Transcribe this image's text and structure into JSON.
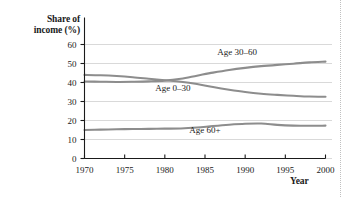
{
  "chart_data": {
    "type": "line",
    "title": "",
    "xlabel": "Year",
    "ylabel": "Share of\nincome (%)",
    "xlim": [
      1970,
      2000
    ],
    "ylim": [
      0,
      60
    ],
    "xticks": [
      1970,
      1975,
      1980,
      1985,
      1990,
      1995,
      2000
    ],
    "yticks": [
      0,
      10,
      20,
      30,
      40,
      50,
      60
    ],
    "grid": "horizontal",
    "legend": "inline-labels",
    "line_color": "#8d8d8d",
    "axis_color": "#1a1a1a",
    "grid_color": "#c9c9c9",
    "x": [
      1970,
      1972,
      1974,
      1976,
      1978,
      1980,
      1982,
      1984,
      1986,
      1988,
      1990,
      1992,
      1994,
      1996,
      1998,
      2000
    ],
    "series": [
      {
        "name": "Age 30-60",
        "label": "Age 30–60",
        "label_x": 1989,
        "label_y": 54.5,
        "values": [
          40.5,
          40.4,
          40.3,
          40.4,
          40.6,
          41.0,
          42.0,
          43.6,
          45.2,
          46.6,
          47.7,
          48.6,
          49.3,
          49.9,
          50.6,
          51.0
        ]
      },
      {
        "name": "Age 0-30",
        "label": "Age 0–30",
        "label_x": 1981,
        "label_y": 35.5,
        "values": [
          44.0,
          43.8,
          43.4,
          42.8,
          42.0,
          41.2,
          40.4,
          39.2,
          37.6,
          36.2,
          35.0,
          34.1,
          33.5,
          33.0,
          32.6,
          32.5
        ]
      },
      {
        "name": "Age 60+",
        "label": "Age 60+",
        "label_x": 1985,
        "label_y": 13.3,
        "values": [
          15.0,
          15.2,
          15.4,
          15.5,
          15.6,
          15.7,
          15.8,
          16.3,
          17.1,
          17.8,
          18.3,
          18.4,
          17.7,
          17.3,
          17.2,
          17.3
        ]
      }
    ]
  }
}
